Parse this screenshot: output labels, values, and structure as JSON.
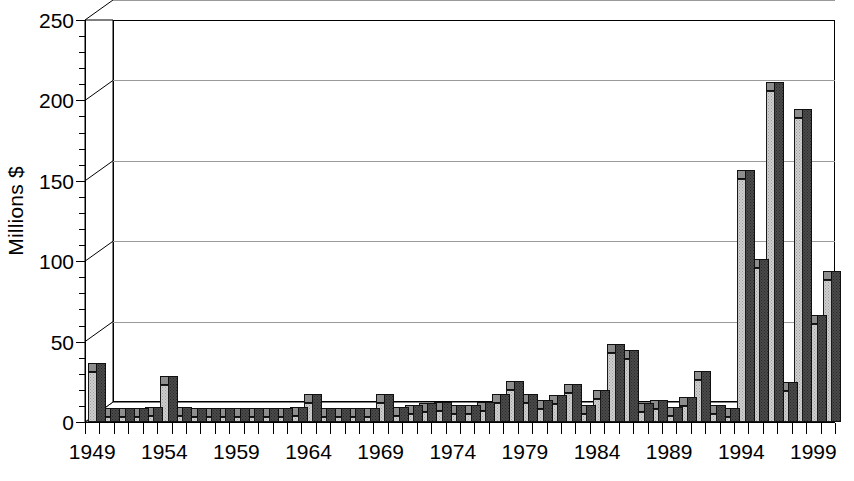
{
  "chart_data": {
    "type": "bar",
    "title": "",
    "subtitle": "",
    "xlabel": "",
    "ylabel": "Millions $",
    "ylim": [
      0,
      250
    ],
    "ytick_values": [
      0,
      50,
      100,
      150,
      200,
      250
    ],
    "ytick_labels": [
      "0",
      "50",
      "100",
      "150",
      "200",
      "250"
    ],
    "yminor_step": 10,
    "grid": "horizontal",
    "legend": "none",
    "style": "3d-column",
    "xlim_years": [
      1949,
      2000
    ],
    "xtick_labels": [
      "1949",
      "1954",
      "1959",
      "1964",
      "1969",
      "1974",
      "1979",
      "1984",
      "1989",
      "1994",
      "1999"
    ],
    "xtick_years": [
      1949,
      1954,
      1959,
      1964,
      1969,
      1974,
      1979,
      1984,
      1989,
      1994,
      1999
    ],
    "categories": [
      "1949",
      "1950",
      "1951",
      "1952",
      "1953",
      "1954",
      "1955",
      "1956",
      "1957",
      "1958",
      "1959",
      "1960",
      "1961",
      "1962",
      "1963",
      "1964",
      "1965",
      "1966",
      "1967",
      "1968",
      "1969",
      "1970",
      "1971",
      "1972",
      "1973",
      "1974",
      "1975",
      "1976",
      "1977",
      "1978",
      "1979",
      "1980",
      "1981",
      "1982",
      "1983",
      "1984",
      "1985",
      "1986",
      "1987",
      "1988",
      "1989",
      "1990",
      "1991",
      "1992",
      "1993",
      "1994",
      "1995",
      "1996",
      "1997",
      "1998",
      "1999",
      "2000"
    ],
    "values": [
      31,
      3,
      3,
      3,
      4,
      23,
      4,
      3,
      3,
      3,
      3,
      3,
      3,
      3,
      4,
      12,
      3,
      3,
      3,
      3,
      12,
      4,
      5,
      6,
      7,
      5,
      5,
      7,
      12,
      20,
      12,
      8,
      11,
      18,
      5,
      14,
      43,
      39,
      6,
      8,
      4,
      10,
      26,
      5,
      3,
      151,
      96,
      206,
      19,
      189,
      61,
      88
    ],
    "colors": {
      "bar_front": "#cfcfcf",
      "bar_side": "#4a4a4a",
      "bar_top": "#8d8d8d",
      "gridline": "#9a9a9a",
      "axis": "#000000",
      "background": "#ffffff"
    }
  }
}
